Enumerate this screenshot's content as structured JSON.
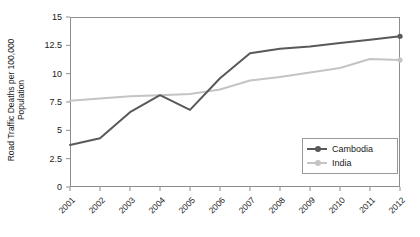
{
  "chart_data": {
    "type": "line",
    "title": "",
    "xlabel": "",
    "ylabel": "Road Traffic Deaths per 100,000 Population",
    "ylabel_line1": "Road Traffic Deaths per 100,000",
    "ylabel_line2": "Population",
    "categories": [
      "2001",
      "2002",
      "2003",
      "2004",
      "2005",
      "2006",
      "2007",
      "2008",
      "2009",
      "2010",
      "2011",
      "2012"
    ],
    "ylim": [
      0,
      15
    ],
    "yticks": [
      0,
      2.5,
      5,
      7.5,
      10,
      12.5,
      15
    ],
    "ytick_labels": [
      "0",
      "2.5",
      "5",
      "7.5",
      "10",
      "12.5",
      "15"
    ],
    "grid": false,
    "legend_position": "bottom-right",
    "series": [
      {
        "name": "Cambodia",
        "color": "#595959",
        "marker": "circle",
        "values": [
          3.7,
          4.3,
          6.6,
          8.1,
          6.8,
          9.6,
          11.8,
          12.2,
          12.4,
          12.7,
          13.0,
          13.3
        ]
      },
      {
        "name": "India",
        "color": "#c4c4c4",
        "marker": "circle",
        "values": [
          7.6,
          7.8,
          8.0,
          8.1,
          8.2,
          8.6,
          9.4,
          9.7,
          10.1,
          10.5,
          11.3,
          11.2
        ]
      }
    ]
  },
  "legend": {
    "entries": [
      {
        "label": "Cambodia",
        "color": "#595959"
      },
      {
        "label": "India",
        "color": "#c4c4c4"
      }
    ]
  },
  "axes": {
    "frame_color": "#8d8d8d",
    "tick_color": "#8d8d8d",
    "text_color": "#1a1a1a"
  }
}
